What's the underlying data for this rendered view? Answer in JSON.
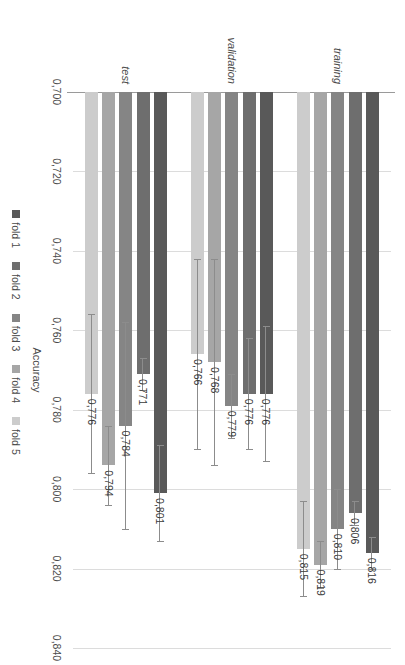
{
  "chart_data": {
    "type": "bar",
    "orientation": "vertical",
    "title": "",
    "xlabel": "",
    "ylabel": "Accuracy",
    "ylim": [
      0.7,
      0.84
    ],
    "yticks": [
      0.7,
      0.72,
      0.74,
      0.76,
      0.78,
      0.8,
      0.82,
      0.84
    ],
    "ytick_labels": [
      "0,700",
      "0,720",
      "0,740",
      "0,760",
      "0,780",
      "0,800",
      "0,820",
      "0,840"
    ],
    "decimal_separator": ",",
    "grid": true,
    "grid_axis": "y",
    "legend_position": "bottom",
    "categories": [
      "training",
      "validation",
      "test"
    ],
    "series": [
      {
        "name": "fold 1",
        "color": "#595959",
        "values": [
          0.816,
          0.776,
          0.801
        ],
        "value_labels": [
          "0,816",
          "0,776",
          "0,801"
        ],
        "errors": [
          0.004,
          0.017,
          0.012
        ]
      },
      {
        "name": "fold 2",
        "color": "#6e6e6e",
        "values": [
          0.806,
          0.776,
          0.771
        ],
        "value_labels": [
          "0,806",
          "0,776",
          "0,771"
        ],
        "errors": [
          0.003,
          0.014,
          0.004
        ]
      },
      {
        "name": "fold 3",
        "color": "#858585",
        "values": [
          0.81,
          0.779,
          0.784
        ],
        "value_labels": [
          "0,810",
          "0,779",
          "0,784"
        ],
        "errors": [
          0.01,
          0.008,
          0.026
        ]
      },
      {
        "name": "fold 4",
        "color": "#a6a6a6",
        "values": [
          0.819,
          0.768,
          0.794
        ],
        "value_labels": [
          "0,819",
          "0,768",
          "0,794"
        ],
        "errors": [
          0.006,
          0.026,
          0.01
        ]
      },
      {
        "name": "fold 5",
        "color": "#cccccc",
        "values": [
          0.815,
          0.766,
          0.776
        ],
        "value_labels": [
          "0,815",
          "0,766",
          "0,776"
        ],
        "errors": [
          0.012,
          0.024,
          0.02
        ]
      }
    ]
  },
  "legend": {
    "items": [
      {
        "label": "fold 1",
        "color": "#595959"
      },
      {
        "label": "fold 2",
        "color": "#6e6e6e"
      },
      {
        "label": "fold 3",
        "color": "#858585"
      },
      {
        "label": "fold 4",
        "color": "#a6a6a6"
      },
      {
        "label": "fold 5",
        "color": "#cccccc"
      }
    ]
  },
  "axis": {
    "value_axis_title": "Accuracy"
  }
}
